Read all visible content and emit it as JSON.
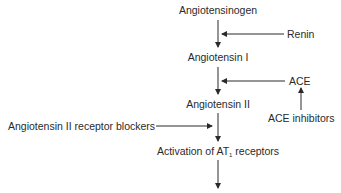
{
  "diagram": {
    "nodes": {
      "angiotensinogen": "Angiotensinogen",
      "angiotensin_i": "Angiotensin I",
      "angiotensin_ii": "Angiotensin II",
      "activation_prefix": "Activation of AT",
      "activation_sub": "1",
      "activation_suffix": " receptors"
    },
    "modifiers": {
      "renin": "Renin",
      "ace": "ACE",
      "ace_inhibitors": "ACE inhibitors",
      "arb": "Angiotensin II receptor blockers"
    },
    "colors": {
      "text": "#2a2a2a",
      "line": "#2a2a2a",
      "background": "#ffffff"
    }
  }
}
